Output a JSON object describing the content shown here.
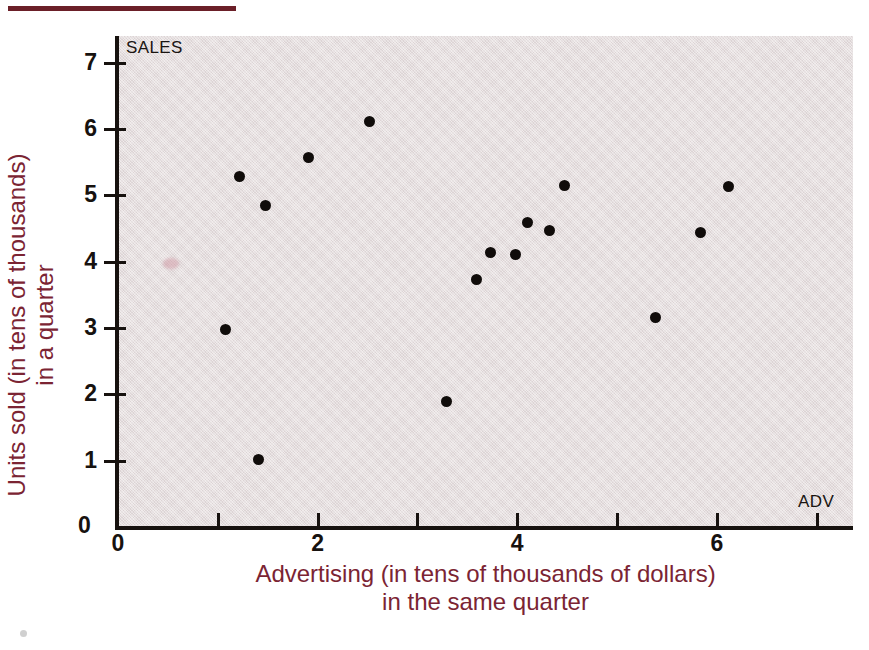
{
  "figure": {
    "top_rule_color": "#6b1f28",
    "panel_color": "#e4dbdc",
    "axis_color": "#17120f",
    "title_color": "#7b2433",
    "point_color": "#100c0a",
    "in_plot_y_name": "SALES",
    "in_plot_x_name": "ADV"
  },
  "axis_titles": {
    "y_line1": "Units sold (in tens of thousands)",
    "y_line2": "in a quarter",
    "x_line1": "Advertising (in tens of thousands of dollars)",
    "x_line2": "in the same quarter"
  },
  "ticks": {
    "y_labels": [
      "7",
      "6",
      "5",
      "4",
      "3",
      "2",
      "1",
      "0"
    ],
    "x_labels": [
      "0",
      "2",
      "4",
      "6"
    ],
    "origin_label": "0"
  },
  "chart_data": {
    "type": "scatter",
    "title": "",
    "subtitle": "",
    "xlabel": "Advertising (in tens of thousands of dollars) in the same quarter",
    "ylabel": "Units sold (in tens of thousands) in a quarter",
    "x_axis_name_in_plot": "ADV",
    "y_axis_name_in_plot": "SALES",
    "xlim": [
      0,
      7.35
    ],
    "ylim": [
      0,
      7.4
    ],
    "x_ticks": [
      0,
      1,
      2,
      3,
      4,
      5,
      6,
      7
    ],
    "x_tick_labels_shown": [
      0,
      2,
      4,
      6
    ],
    "y_ticks": [
      0,
      1,
      2,
      3,
      4,
      5,
      6,
      7
    ],
    "y_tick_labels_shown": [
      0,
      1,
      2,
      3,
      4,
      5,
      6,
      7
    ],
    "grid": false,
    "legend": false,
    "marker": "filled-circle",
    "n_points": 17,
    "points": [
      {
        "x": 1.08,
        "y": 2.98
      },
      {
        "x": 1.22,
        "y": 5.29
      },
      {
        "x": 1.41,
        "y": 1.01
      },
      {
        "x": 1.48,
        "y": 4.85
      },
      {
        "x": 1.91,
        "y": 5.57
      },
      {
        "x": 2.52,
        "y": 6.11
      },
      {
        "x": 3.29,
        "y": 1.89
      },
      {
        "x": 3.59,
        "y": 3.73
      },
      {
        "x": 3.73,
        "y": 4.14
      },
      {
        "x": 3.98,
        "y": 4.11
      },
      {
        "x": 4.1,
        "y": 4.59
      },
      {
        "x": 4.32,
        "y": 4.47
      },
      {
        "x": 4.47,
        "y": 5.15
      },
      {
        "x": 5.39,
        "y": 3.15
      },
      {
        "x": 5.84,
        "y": 4.44
      },
      {
        "x": 6.12,
        "y": 5.13
      }
    ]
  }
}
